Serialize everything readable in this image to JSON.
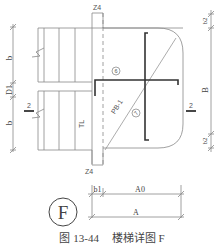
{
  "diagram": {
    "title": "楼梯详图 F",
    "figure_number": "图 13-44",
    "detail_symbol": "F",
    "column_labels": {
      "top": "Z4",
      "bottom": "Z4"
    },
    "left_dimensions": [
      "b",
      "D1",
      "b"
    ],
    "right_dimensions": [
      "b2",
      "B",
      "b2"
    ],
    "bottom_dimensions": {
      "row1": [
        "b1",
        "A0"
      ],
      "row2": [
        "A"
      ]
    },
    "slab_label": "PB-1",
    "callouts": [
      "⑥",
      "⑦"
    ],
    "tl_label": "TL",
    "section_marks": [
      "2",
      "2"
    ],
    "colors": {
      "line": "#8a8a8a",
      "thick": "#333333",
      "text": "#444444"
    }
  }
}
